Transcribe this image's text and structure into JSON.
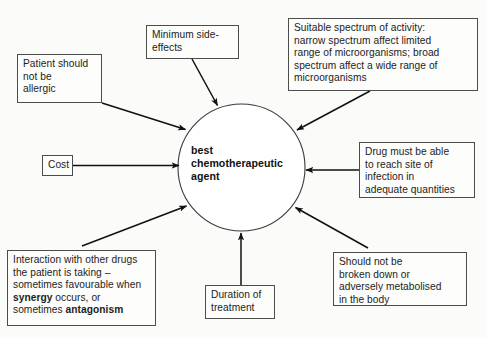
{
  "diagram": {
    "title_hidden": "",
    "hub": {
      "label": "best\nchemotherapeutic\nagent",
      "shape": "circle"
    },
    "nodes": [
      {
        "id": "patient-allergic",
        "label": "Patient should\nnot be\nallergic"
      },
      {
        "id": "minimum-side-effects",
        "label": "Minimum side-\neffects"
      },
      {
        "id": "suitable-spectrum",
        "label": "Suitable spectrum of activity:\nnarrow spectrum affect limited\nrange of microorganisms; broad\nspectrum affect a wide range of\nmicroorganisms"
      },
      {
        "id": "cost",
        "label": "Cost"
      },
      {
        "id": "reach-site",
        "label": "Drug must be able\nto reach site of\ninfection in\nadequate quantities"
      },
      {
        "id": "interaction",
        "label_part1": "Interaction with other drugs the patient is taking – sometimes favourable when ",
        "label_bold1": "synergy",
        "label_part2": " occurs, or sometimes ",
        "label_bold2": "antagonism",
        "label_plain": "Interaction with other drugs the patient is taking – sometimes favourable when synergy occurs, or sometimes antagonism"
      },
      {
        "id": "duration",
        "label": "Duration of\ntreatment"
      },
      {
        "id": "metabolised",
        "label": "Should not be\nbroken down or\nadversely metabolised\nin the body"
      }
    ],
    "arrows": [
      {
        "from": "patient-allergic",
        "to": "hub",
        "direction": "to-hub"
      },
      {
        "from": "minimum-side-effects",
        "to": "hub",
        "direction": "to-hub"
      },
      {
        "from": "suitable-spectrum",
        "to": "hub",
        "direction": "to-hub"
      },
      {
        "from": "cost",
        "to": "hub",
        "direction": "to-hub"
      },
      {
        "from": "reach-site",
        "to": "hub",
        "direction": "to-hub"
      },
      {
        "from": "interaction",
        "to": "hub",
        "direction": "to-hub"
      },
      {
        "from": "duration",
        "to": "hub",
        "direction": "to-hub"
      },
      {
        "from": "metabolised",
        "to": "hub",
        "direction": "to-hub"
      }
    ],
    "colors": {
      "background": "#fbfbf9",
      "box_fill": "#fdfdfb",
      "box_border": "#4c4c4c",
      "line": "#111111",
      "text": "#1c1c1c"
    }
  }
}
